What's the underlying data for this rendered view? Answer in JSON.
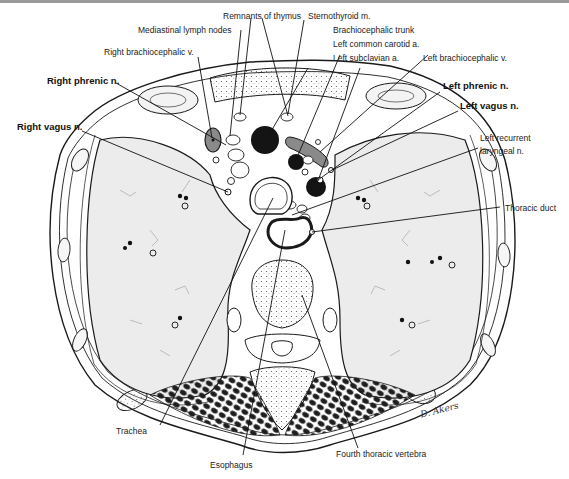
{
  "figure": {
    "signature": "D. Akers"
  },
  "labels": {
    "remnants_of_thymus": "Remnants of thymus",
    "sternothyroid": "Sternothyroid m.",
    "mediastinal_lymph_nodes": "Mediastinal lymph nodes",
    "brachiocephalic_trunk": "Brachiocephalic trunk",
    "left_common_carotid": "Left common carotid a.",
    "left_subclavian": "Left subclavian a.",
    "right_brachiocephalic_v": "Right brachiocephalic v.",
    "left_brachiocephalic_v": "Left brachiocephalic v.",
    "right_phrenic": "Right phrenic n.",
    "left_phrenic": "Left phrenic n.",
    "right_vagus": "Right vagus n.",
    "left_vagus": "Left vagus n.",
    "left_recurrent_1": "Left recurrent",
    "left_recurrent_2": "laryngeal n.",
    "thoracic_duct": "Thoracic duct",
    "trachea": "Trachea",
    "esophagus": "Esophagus",
    "fourth_thoracic_vertebra": "Fourth thoracic vertebra"
  },
  "colors": {
    "ink": "#1a1a1a",
    "lung_fill": "#ececec",
    "vessel_dark": "#141414",
    "vein_gray": "#8a8a8a",
    "top_rule": "#9a9a9a"
  }
}
